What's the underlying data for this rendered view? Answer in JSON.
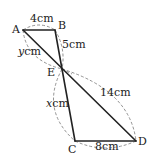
{
  "diagram": {
    "type": "geometry-figure",
    "points": {
      "A": {
        "label": "A",
        "x": 23,
        "y": 30
      },
      "B": {
        "label": "B",
        "x": 55,
        "y": 30
      },
      "E": {
        "label": "E",
        "x": 62,
        "y": 69
      },
      "C": {
        "label": "C",
        "x": 75,
        "y": 141
      },
      "D": {
        "label": "D",
        "x": 136,
        "y": 141
      }
    },
    "segments": [
      {
        "from": "A",
        "to": "B",
        "length_label": "4cm"
      },
      {
        "from": "B",
        "to": "E",
        "length_label": "5cm"
      },
      {
        "from": "A",
        "to": "E",
        "length_label": "ycm"
      },
      {
        "from": "E",
        "to": "C",
        "length_label": "xcm"
      },
      {
        "from": "E",
        "to": "D",
        "length_label": "14cm"
      },
      {
        "from": "C",
        "to": "D",
        "length_label": "8cm"
      }
    ],
    "labels": {
      "A": "A",
      "B": "B",
      "E": "E",
      "C": "C",
      "D": "D",
      "AB": "4cm",
      "BE": "5cm",
      "AE_var": "y",
      "AE_unit": "cm",
      "EC_var": "x",
      "EC_unit": "cm",
      "ED": "14cm",
      "CD": "8cm"
    },
    "colors": {
      "line": "#222222",
      "dashed_arc": "#777777",
      "background": "#ffffff"
    }
  }
}
